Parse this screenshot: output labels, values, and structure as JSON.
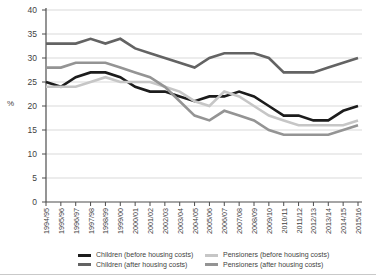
{
  "chart_data": {
    "type": "line",
    "title": "",
    "xlabel": "",
    "ylabel": "%",
    "ylim": [
      0,
      40
    ],
    "yticks": [
      0,
      5,
      10,
      15,
      20,
      25,
      30,
      35,
      40
    ],
    "grid": true,
    "legend_position": "bottom",
    "categories": [
      "1994/95",
      "1995/96",
      "1996/97",
      "1997/98",
      "1998/99",
      "1999/00",
      "2000/01",
      "2001/02",
      "2002/03",
      "2003/04",
      "2004/05",
      "2005/06",
      "2006/07",
      "2007/08",
      "2008/09",
      "2009/10",
      "2010/11",
      "2011/12",
      "2012/13",
      "2013/14",
      "2014/15",
      "2015/16"
    ],
    "series": [
      {
        "name": "Children (before housing costs)",
        "color": "#1c1c1c",
        "values": [
          25,
          24,
          26,
          27,
          27,
          26,
          24,
          23,
          23,
          22,
          21,
          22,
          22,
          23,
          22,
          20,
          18,
          18,
          17,
          17,
          19,
          20
        ]
      },
      {
        "name": "Children (after housing costs)",
        "color": "#636363",
        "values": [
          33,
          33,
          33,
          34,
          33,
          34,
          32,
          31,
          30,
          29,
          28,
          30,
          31,
          31,
          31,
          30,
          27,
          27,
          27,
          28,
          29,
          30
        ]
      },
      {
        "name": "Pensioners (before housing costs)",
        "color": "#c6c6c6",
        "values": [
          24,
          24,
          24,
          25,
          26,
          25,
          25,
          25,
          24,
          23,
          21,
          20,
          23,
          22,
          20,
          18,
          17,
          16,
          16,
          16,
          16,
          17
        ]
      },
      {
        "name": "Pensioners (after housing costs)",
        "color": "#949494",
        "values": [
          28,
          28,
          29,
          29,
          29,
          28,
          27,
          26,
          24,
          21,
          18,
          17,
          19,
          18,
          17,
          15,
          14,
          14,
          14,
          14,
          15,
          16
        ]
      }
    ]
  },
  "colors": {
    "background": "#ffffff",
    "gridline": "#d9d9d9",
    "axis": "#4d4d4d",
    "tick_label": "#3f3f3f",
    "divider": "#c9c9c9"
  }
}
